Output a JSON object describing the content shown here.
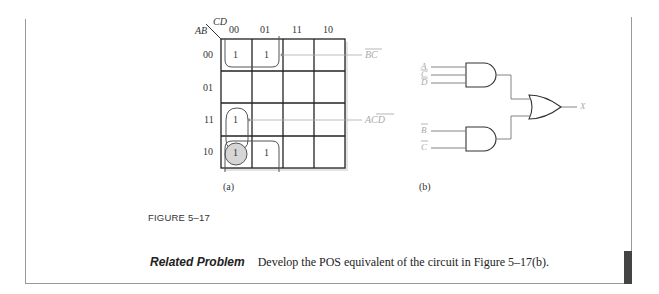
{
  "kmap": {
    "corner_row_var": "AB",
    "corner_col_var": "CD",
    "col_headers": [
      "00",
      "01",
      "11",
      "10"
    ],
    "row_headers": [
      "00",
      "01",
      "11",
      "10"
    ],
    "cells": [
      [
        "1",
        "1",
        "",
        ""
      ],
      [
        "",
        "",
        "",
        ""
      ],
      [
        "1",
        "",
        "",
        ""
      ],
      [
        "1",
        "1",
        "",
        ""
      ]
    ],
    "groups": [
      {
        "term": "B̄C̄",
        "label": "BC"
      },
      {
        "term": "AC̄D̄",
        "label": "ACD"
      }
    ],
    "caption": "(a)"
  },
  "logic_circuit": {
    "gate1_inputs": [
      "A",
      "C",
      "D"
    ],
    "gate1_inputs_overbar": [
      false,
      true,
      true
    ],
    "gate2_inputs": [
      "B",
      "C"
    ],
    "gate2_inputs_overbar": [
      true,
      true
    ],
    "output": "X",
    "caption": "(b)"
  },
  "figure_title": "FIGURE 5–17",
  "related_problem": {
    "label": "Related Problem",
    "text": "Develop the POS equivalent of the circuit in Figure 5–17(b)."
  }
}
